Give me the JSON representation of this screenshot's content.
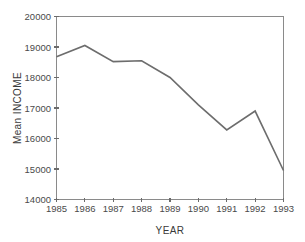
{
  "chart_data": {
    "type": "line",
    "title": "",
    "xlabel": "YEAR",
    "ylabel": "Mean INCOME",
    "x": [
      1985,
      1986,
      1987,
      1988,
      1989,
      1990,
      1991,
      1992,
      1993
    ],
    "categories": [
      "1985",
      "1986",
      "1987",
      "1988",
      "1989",
      "1990",
      "1991",
      "1992",
      "1993"
    ],
    "values": [
      18680,
      19050,
      18520,
      18550,
      18000,
      17100,
      16280,
      16900,
      14950
    ],
    "series": [
      {
        "name": "Mean INCOME",
        "values": [
          18680,
          19050,
          18520,
          18550,
          18000,
          17100,
          16280,
          16900,
          14950
        ]
      }
    ],
    "xlim": [
      1985,
      1993
    ],
    "ylim": [
      14000,
      20000
    ],
    "ytick_labels": [
      "20000",
      "19000",
      "18000",
      "17000",
      "16000",
      "15000",
      "14000"
    ],
    "ytick_values": [
      20000,
      19000,
      18000,
      17000,
      16000,
      15000,
      14000
    ],
    "xtick_labels": [
      "1985",
      "1986",
      "1987",
      "1988",
      "1989",
      "1990",
      "1991",
      "1992",
      "1993"
    ],
    "grid": false,
    "legend": false,
    "legend_position": "none",
    "line_color": "#6d6d6d",
    "axis_color": "#8a8a8a"
  },
  "axes": {
    "y_title": "Mean INCOME",
    "x_title": "YEAR"
  }
}
